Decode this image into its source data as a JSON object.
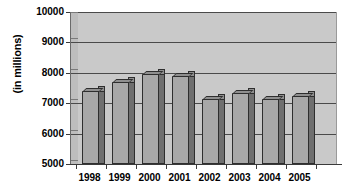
{
  "chart_data": {
    "type": "bar",
    "title": "",
    "subtitle": "",
    "xlabel": "",
    "ylabel": "(in millions)",
    "categories": [
      "1998",
      "1999",
      "2000",
      "2001",
      "2002",
      "2003",
      "2004",
      "2005"
    ],
    "values": [
      7400,
      7700,
      7950,
      7900,
      7150,
      7350,
      7150,
      7250
    ],
    "series": [
      {
        "name": "",
        "values": [
          7400,
          7700,
          7950,
          7900,
          7150,
          7350,
          7150,
          7250
        ]
      }
    ],
    "ylim": [
      5000,
      10000
    ],
    "ytick_labels": [
      "10000",
      "9000",
      "8000",
      "7000",
      "6000",
      "5000"
    ],
    "ytick_values": [
      10000,
      9000,
      8000,
      7000,
      6000,
      5000
    ],
    "grid": true,
    "legend": "none",
    "style": "3d-column",
    "colors": {
      "bar_front": "#a8a8a8",
      "bar_side": "#6f6f6f",
      "bar_top": "#8f8f8f",
      "bar_outline": "#2e2e2e",
      "plot_background": "#c9c9c9",
      "gridline": "#4a4a4a",
      "axis": "#3a3a3a",
      "text": "#000000",
      "page_background": "#ffffff"
    }
  }
}
